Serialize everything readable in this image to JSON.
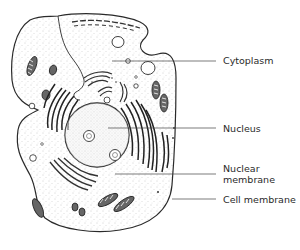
{
  "diagram": {
    "labels": [
      {
        "id": "cytoplasm",
        "text": "Cytoplasm",
        "x": 223,
        "y": 55,
        "line": {
          "x1": 112,
          "y1": 61,
          "x2": 216,
          "y2": 61
        }
      },
      {
        "id": "nucleus",
        "text": "Nucleus",
        "x": 223,
        "y": 123,
        "line": {
          "x1": 108,
          "y1": 128,
          "x2": 216,
          "y2": 128
        }
      },
      {
        "id": "nuclear-membrane",
        "text": "Nuclear",
        "text2": "membrane",
        "x": 223,
        "y": 163,
        "line": {
          "x1": 115,
          "y1": 174,
          "x2": 216,
          "y2": 174
        }
      },
      {
        "id": "cell-membrane",
        "text": "Cell membrane",
        "x": 223,
        "y": 194,
        "line": {
          "x1": 170,
          "y1": 199,
          "x2": 216,
          "y2": 199
        }
      }
    ],
    "colors": {
      "ink": "#2a2a2a",
      "background": "#ffffff",
      "stipple": "#9a9a9a"
    }
  }
}
